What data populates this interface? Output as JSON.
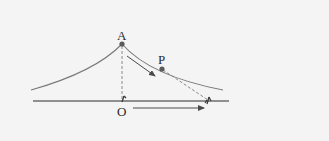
{
  "diagram": {
    "type": "physics-diagram",
    "labels": {
      "peak": "A",
      "point_on_slope": "P",
      "origin": "O"
    },
    "colors": {
      "background": "#f4f4f4",
      "curve": "#7a7a7a",
      "ground": "#6e6e6e",
      "points": "#5a5a5a",
      "dashed": "#8a8a8a",
      "arrows": "#4a4a4a",
      "text": "#2a2a2a"
    },
    "elements": [
      {
        "name": "curved-slope",
        "kind": "curve"
      },
      {
        "name": "ground-line",
        "kind": "line"
      },
      {
        "name": "point-A",
        "kind": "dot",
        "label": "A"
      },
      {
        "name": "point-P",
        "kind": "dot",
        "label": "P"
      },
      {
        "name": "point-O",
        "kind": "label",
        "label": "O"
      },
      {
        "name": "vertical-dashed-A-to-O",
        "kind": "dashed-line"
      },
      {
        "name": "dashed-P-to-observer",
        "kind": "dashed-line"
      },
      {
        "name": "slope-motion-arrow",
        "kind": "arrow"
      },
      {
        "name": "ground-motion-arrow",
        "kind": "arrow"
      },
      {
        "name": "person-at-O",
        "kind": "figure"
      },
      {
        "name": "person-moving",
        "kind": "figure"
      }
    ]
  }
}
